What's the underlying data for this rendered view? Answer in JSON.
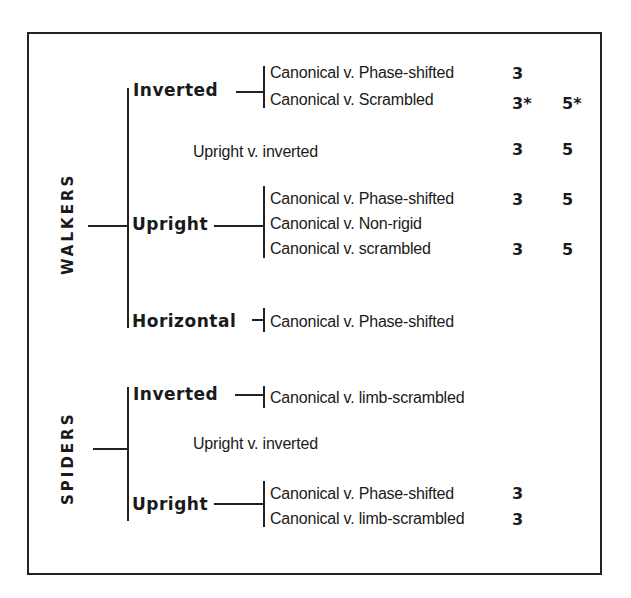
{
  "walkers": {
    "label": "WALKERS",
    "inverted": {
      "label": "Inverted",
      "items": [
        {
          "text": "Canonical v. Phase-shifted",
          "col1": "3",
          "col2": ""
        },
        {
          "text": "Canonical v. Scrambled",
          "col1": "3*",
          "col2": "5*"
        }
      ]
    },
    "comparison": {
      "text": "Upright v. inverted",
      "col1": "3",
      "col2": "5"
    },
    "upright": {
      "label": "Upright",
      "items": [
        {
          "text": "Canonical v. Phase-shifted",
          "col1": "3",
          "col2": "5"
        },
        {
          "text": "Canonical v. Non-rigid",
          "col1": "",
          "col2": ""
        },
        {
          "text": "Canonical v. scrambled",
          "col1": "3",
          "col2": "5"
        }
      ]
    },
    "horizontal": {
      "label": "Horizontal",
      "items": [
        {
          "text": "Canonical v. Phase-shifted",
          "col1": "",
          "col2": ""
        }
      ]
    }
  },
  "spiders": {
    "label": "SPIDERS",
    "inverted": {
      "label": "Inverted",
      "items": [
        {
          "text": "Canonical v. limb-scrambled",
          "col1": "",
          "col2": ""
        }
      ]
    },
    "comparison": {
      "text": "Upright v. inverted",
      "col1": "",
      "col2": ""
    },
    "upright": {
      "label": "Upright",
      "items": [
        {
          "text": "Canonical v. Phase-shifted",
          "col1": "3",
          "col2": ""
        },
        {
          "text": "Canonical v. limb-scrambled",
          "col1": "3",
          "col2": ""
        }
      ]
    }
  },
  "colors": {
    "ink": "#1a1a1a",
    "background": "#ffffff"
  }
}
